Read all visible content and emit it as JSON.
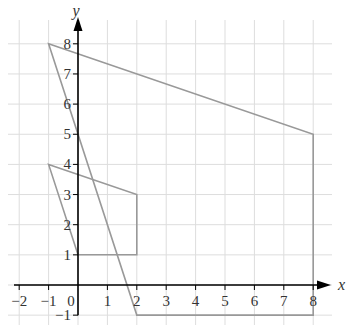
{
  "chart_data": {
    "type": "line",
    "title": "",
    "xlabel": "x",
    "ylabel": "y",
    "xlim": [
      -2,
      8
    ],
    "ylim": [
      -1,
      8
    ],
    "grid": true,
    "x_ticks": [
      "−2",
      "−1",
      "0",
      "1",
      "2",
      "3",
      "4",
      "5",
      "6",
      "7",
      "8"
    ],
    "y_ticks": [
      "−1",
      "1",
      "2",
      "3",
      "4",
      "5",
      "6",
      "7",
      "8"
    ],
    "series": [
      {
        "name": "large quadrilateral",
        "closed": true,
        "points": [
          [
            -1,
            8
          ],
          [
            8,
            5
          ],
          [
            8,
            -1
          ],
          [
            2,
            -1
          ]
        ]
      },
      {
        "name": "small quadrilateral",
        "closed": true,
        "points": [
          [
            -1,
            4
          ],
          [
            2,
            3
          ],
          [
            2,
            1
          ],
          [
            0,
            1
          ]
        ]
      }
    ],
    "colors": {
      "shape": "#999999",
      "axis": "#000000",
      "grid": "#dddddd"
    }
  }
}
